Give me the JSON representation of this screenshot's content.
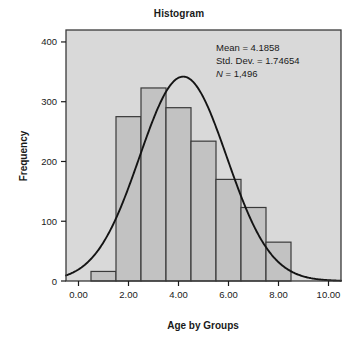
{
  "chart_data": {
    "type": "bar",
    "title": "Histogram",
    "xlabel": "Age by Groups",
    "ylabel": "Frequency",
    "xlim": [
      -0.5,
      10.5
    ],
    "ylim": [
      0,
      420
    ],
    "xticks": [
      "0.00",
      "2.00",
      "4.00",
      "6.00",
      "8.00",
      "10.00"
    ],
    "xtick_values": [
      0,
      2,
      4,
      6,
      8,
      10
    ],
    "yticks": [
      "0",
      "100",
      "200",
      "300",
      "400"
    ],
    "ytick_values": [
      0,
      100,
      200,
      300,
      400
    ],
    "grid": false,
    "legend": "none",
    "bin_width": 1,
    "bin_starts": [
      0.5,
      1.5,
      2.5,
      3.5,
      4.5,
      5.5,
      6.5,
      7.5
    ],
    "bin_centers": [
      1,
      2,
      3,
      4,
      5,
      6,
      7,
      8
    ],
    "categories": [
      "0.5-1.5",
      "1.5-2.5",
      "2.5-3.5",
      "3.5-4.5",
      "4.5-5.5",
      "5.5-6.5",
      "6.5-7.5",
      "7.5-8.5"
    ],
    "values": [
      16,
      275,
      323,
      290,
      234,
      170,
      123,
      65
    ],
    "overlay_curve": {
      "name": "normal-curve",
      "mean": 4.1858,
      "std_dev": 1.74654,
      "n": 1496,
      "peak_value": 342
    }
  },
  "annotation": {
    "mean_line": "Mean = 4.1858",
    "stddev_line": "Std. Dev. = 1.74654",
    "n_symbol": "N",
    "n_line": " = 1,496"
  },
  "colors": {
    "plot_background": "#d9d9d9",
    "bar_fill": "#c2c2c2",
    "bar_border": "#3a3a3a",
    "curve": "#141414",
    "axis": "#1a1a1a",
    "text": "#1a1a1a",
    "page_background": "#ffffff"
  }
}
